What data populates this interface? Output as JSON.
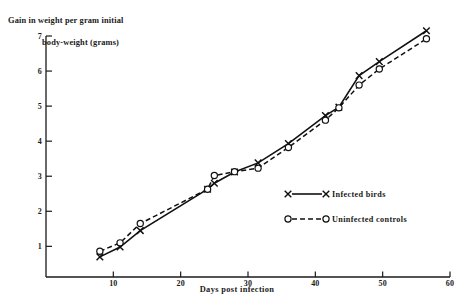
{
  "chart_data": {
    "type": "line",
    "title": "",
    "ylabel_line1": "Gain in weight per gram initial",
    "ylabel_line2": "body-weight (grams)",
    "xlabel": "Days post infection",
    "xlim": [
      0,
      60
    ],
    "ylim": [
      0,
      7
    ],
    "xticks": [
      10,
      20,
      30,
      40,
      50,
      60
    ],
    "yticks": [
      1,
      2,
      3,
      4,
      5,
      6,
      7
    ],
    "grid": false,
    "legend_position": "center-right",
    "series": [
      {
        "name": "Infected birds",
        "marker": "x",
        "linestyle": "solid",
        "color": "#111111",
        "x": [
          8,
          11,
          14,
          24,
          25,
          28,
          31.5,
          36,
          41.5,
          43.5,
          46.5,
          49.5,
          56.5
        ],
        "y": [
          0.7,
          0.98,
          1.45,
          2.63,
          2.8,
          3.12,
          3.38,
          3.93,
          4.73,
          4.97,
          5.87,
          6.27,
          7.15
        ]
      },
      {
        "name": "Uninfected controls",
        "marker": "o",
        "linestyle": "dashed",
        "color": "#111111",
        "x": [
          8,
          11,
          14,
          24,
          25,
          28,
          31.5,
          36,
          41.5,
          43.5,
          46.5,
          49.5,
          56.5
        ],
        "y": [
          0.86,
          1.1,
          1.65,
          2.63,
          3.02,
          3.13,
          3.23,
          3.82,
          4.6,
          4.95,
          5.6,
          6.06,
          6.92
        ]
      }
    ]
  },
  "axis": {
    "x_tick_labels": [
      "10",
      "20",
      "30",
      "40",
      "50",
      "60"
    ],
    "y_tick_labels": [
      "1",
      "2",
      "3",
      "4",
      "5",
      "6",
      "7"
    ],
    "x_title": "Days post infection",
    "y_title_line1": "Gain in weight per gram initial",
    "y_title_line2": "body-weight (grams)"
  },
  "legend": {
    "entries": [
      {
        "label": "Infected birds",
        "marker": "x-marker",
        "style": "solid"
      },
      {
        "label": "Uninfected controls",
        "marker": "circle-marker",
        "style": "dashed"
      }
    ]
  }
}
